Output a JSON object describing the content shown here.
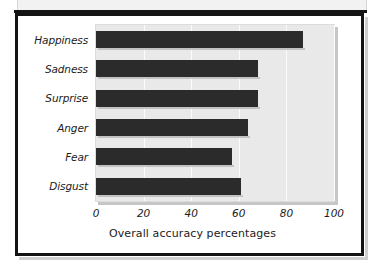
{
  "figure": {
    "frame_color": "#131313",
    "panel_color": "#e9e9e9",
    "bar_color": "#2b2b2b"
  },
  "chart_data": {
    "type": "bar",
    "orientation": "horizontal",
    "title": "",
    "subtitle": "",
    "xlabel": "Overall accuracy percentages",
    "ylabel": "",
    "categories": [
      "Happiness",
      "Sadness",
      "Surprise",
      "Anger",
      "Fear",
      "Disgust"
    ],
    "values": [
      87,
      68,
      68,
      64,
      57,
      61
    ],
    "xlim": [
      0,
      100
    ],
    "xticks": [
      0,
      20,
      40,
      60,
      80,
      100
    ],
    "xticklabels": [
      "0",
      "20",
      "40",
      "60",
      "80",
      "100"
    ],
    "grid": "vertical",
    "legend": "none",
    "series": [
      {
        "name": "Overall accuracy percentages",
        "values": [
          87,
          68,
          68,
          64,
          57,
          61
        ]
      }
    ]
  }
}
